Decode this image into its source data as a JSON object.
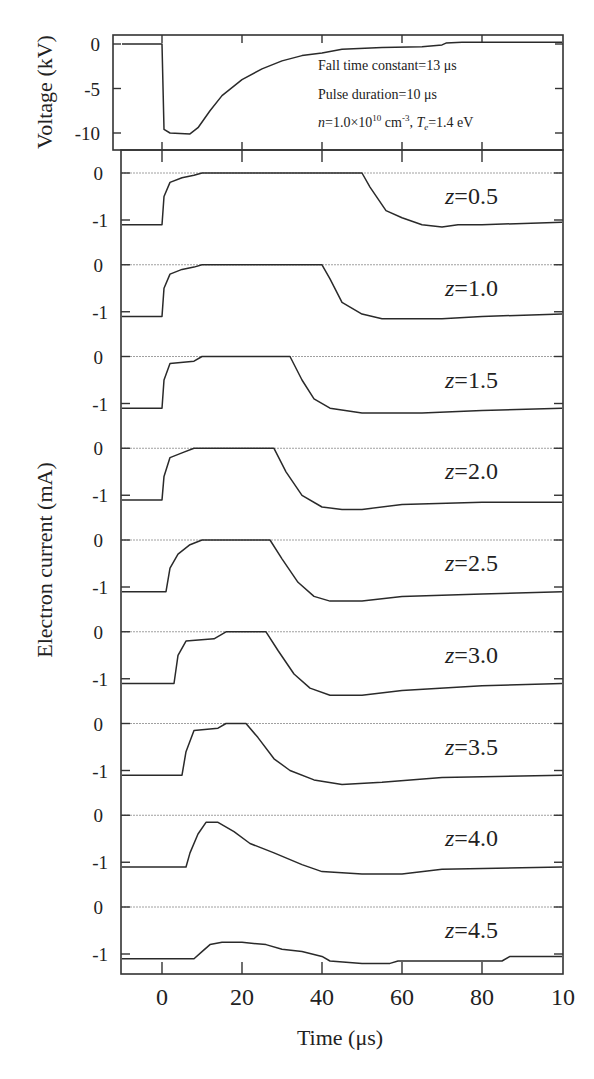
{
  "chart_data": [
    {
      "type": "line",
      "panel": "voltage",
      "ylabel": "Voltage (kV)",
      "yticks": [
        "0",
        "-5",
        "-10"
      ],
      "ylim": [
        -12,
        1
      ],
      "xlim": [
        -10,
        100
      ],
      "annotations": [
        "Fall time constant=13 μs",
        "Pulse duration=10 μs",
        "n=1.0×10^10 cm^-3, Te=1.4 eV"
      ],
      "series": [
        {
          "name": "Voltage",
          "x": [
            -10,
            0,
            0.5,
            2,
            7,
            9,
            12,
            15,
            20,
            25,
            30,
            35,
            40,
            45,
            55,
            65,
            70,
            71,
            75,
            100
          ],
          "y": [
            0,
            0,
            -9.6,
            -10,
            -10.1,
            -9.4,
            -7.5,
            -5.8,
            -4.0,
            -2.8,
            -1.9,
            -1.3,
            -1.0,
            -0.6,
            -0.4,
            -0.3,
            -0.1,
            0.1,
            0.2,
            0.2
          ]
        }
      ]
    },
    {
      "type": "line",
      "panel": "electron_current",
      "ylabel": "Electron current (mA)",
      "xlabel": "Time (μs)",
      "xticks": [
        "0",
        "20",
        "40",
        "60",
        "80",
        "10"
      ],
      "xlim": [
        -10,
        100
      ],
      "yticks": [
        "0",
        "-1"
      ],
      "series": [
        {
          "name": "z=0.5",
          "x": [
            -10,
            0,
            0.5,
            2,
            5,
            8,
            10,
            25,
            50,
            52,
            56,
            60,
            65,
            70,
            74,
            80,
            100
          ],
          "y": [
            -1.1,
            -1.1,
            -0.5,
            -0.2,
            -0.1,
            -0.05,
            0,
            0,
            0,
            -0.3,
            -0.8,
            -0.95,
            -1.1,
            -1.15,
            -1.1,
            -1.1,
            -1.05
          ]
        },
        {
          "name": "z=1.0",
          "x": [
            -10,
            0,
            0.5,
            2,
            5,
            8,
            10,
            30,
            40,
            42,
            45,
            50,
            55,
            70,
            80,
            100
          ],
          "y": [
            -1.1,
            -1.1,
            -0.5,
            -0.2,
            -0.1,
            -0.05,
            0,
            0,
            0,
            -0.3,
            -0.8,
            -1.05,
            -1.15,
            -1.15,
            -1.1,
            -1.05
          ]
        },
        {
          "name": "z=1.5",
          "x": [
            -10,
            0,
            0.5,
            2,
            8,
            10,
            32,
            35,
            38,
            42,
            50,
            65,
            80,
            100
          ],
          "y": [
            -1.1,
            -1.1,
            -0.5,
            -0.15,
            -0.1,
            0,
            0,
            -0.5,
            -0.9,
            -1.1,
            -1.2,
            -1.2,
            -1.15,
            -1.1
          ]
        },
        {
          "name": "z=2.0",
          "x": [
            -10,
            0,
            0.5,
            2,
            5,
            8,
            28,
            31,
            35,
            40,
            45,
            50,
            60,
            80,
            100
          ],
          "y": [
            -1.1,
            -1.1,
            -0.6,
            -0.2,
            -0.1,
            0,
            0,
            -0.5,
            -1.0,
            -1.25,
            -1.3,
            -1.3,
            -1.2,
            -1.15,
            -1.15
          ]
        },
        {
          "name": "z=2.5",
          "x": [
            -10,
            1,
            2,
            4,
            7,
            10,
            27,
            30,
            34,
            38,
            42,
            50,
            60,
            80,
            100
          ],
          "y": [
            -1.1,
            -1.1,
            -0.6,
            -0.3,
            -0.1,
            0,
            0,
            -0.4,
            -0.9,
            -1.2,
            -1.3,
            -1.3,
            -1.2,
            -1.15,
            -1.1
          ]
        },
        {
          "name": "z=3.0",
          "x": [
            -10,
            3,
            4,
            6,
            13,
            16,
            26,
            29,
            33,
            37,
            42,
            50,
            60,
            80,
            100
          ],
          "y": [
            -1.1,
            -1.1,
            -0.5,
            -0.2,
            -0.15,
            0,
            0,
            -0.4,
            -0.9,
            -1.2,
            -1.35,
            -1.35,
            -1.25,
            -1.15,
            -1.1
          ]
        },
        {
          "name": "z=3.5",
          "x": [
            -10,
            5,
            6,
            8,
            14,
            16,
            21,
            24,
            28,
            32,
            38,
            45,
            55,
            70,
            100
          ],
          "y": [
            -1.1,
            -1.1,
            -0.6,
            -0.15,
            -0.1,
            0,
            0,
            -0.3,
            -0.75,
            -1.0,
            -1.2,
            -1.3,
            -1.25,
            -1.15,
            -1.1
          ]
        },
        {
          "name": "z=4.0",
          "x": [
            -10,
            6,
            7,
            9,
            11,
            14,
            18,
            22,
            28,
            35,
            40,
            50,
            60,
            70,
            100
          ],
          "y": [
            -1.1,
            -1.1,
            -0.8,
            -0.4,
            -0.15,
            -0.15,
            -0.35,
            -0.6,
            -0.8,
            -1.05,
            -1.2,
            -1.25,
            -1.25,
            -1.15,
            -1.1
          ]
        },
        {
          "name": "z=4.5",
          "x": [
            -10,
            8,
            10,
            12,
            15,
            20,
            26,
            30,
            35,
            40,
            42,
            50,
            57,
            59,
            85,
            87,
            100
          ],
          "y": [
            -1.1,
            -1.1,
            -0.95,
            -0.8,
            -0.75,
            -0.75,
            -0.8,
            -0.9,
            -0.95,
            -1.05,
            -1.15,
            -1.2,
            -1.2,
            -1.15,
            -1.15,
            -1.05,
            -1.05
          ]
        }
      ]
    }
  ],
  "voltage_panel": {
    "ylabel": "Voltage (kV)",
    "yticks": [
      "0",
      "-5",
      "-10"
    ],
    "annotations": {
      "fall_time": "Fall time constant=13 μs",
      "pulse_duration": "Pulse duration=10 μs",
      "density_prefix": "n",
      "density_eq": "=1.0×10",
      "density_exp": "10",
      "density_unit": " cm",
      "density_unit_exp": "-3",
      "temp_sep": ", ",
      "temp_sym": "T",
      "temp_sub": "e",
      "temp_eq": "=1.4 eV"
    }
  },
  "current_panel": {
    "ylabel": "Electron current (mA)",
    "ytick_zero": "0",
    "ytick_minus1": "-1",
    "z_labels": [
      "0.5",
      "1.0",
      "1.5",
      "2.0",
      "2.5",
      "3.0",
      "3.5",
      "4.0",
      "4.5"
    ],
    "z_prefix": "z"
  },
  "x_axis": {
    "label": "Time (μs)",
    "ticks": [
      "0",
      "20",
      "40",
      "60",
      "80",
      "10"
    ]
  }
}
